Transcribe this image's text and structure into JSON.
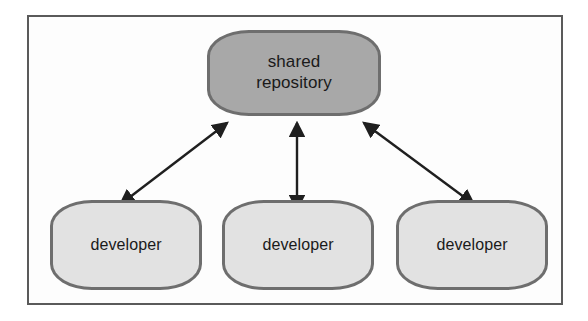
{
  "figure": {
    "type": "diagram",
    "subtype": "centralized-version-control-topology",
    "background_color": "#ffffff",
    "frame": {
      "border_color": "#5a5a5a",
      "fill_color": "#fdfdfd",
      "x": 27,
      "y": 15,
      "width": 536,
      "height": 290
    }
  },
  "nodes": {
    "repository": {
      "id": "shared-repository",
      "label_line1": "shared",
      "label_line2": "repository",
      "fill_color": "#a8a8a8",
      "border_color": "#6e6e6e",
      "x": 207,
      "y": 30,
      "width": 174,
      "height": 86
    },
    "developers": [
      {
        "id": "developer-1",
        "label": "developer",
        "fill_color": "#e2e2e2",
        "border_color": "#6e6e6e",
        "x": 50,
        "y": 200,
        "width": 152,
        "height": 90
      },
      {
        "id": "developer-2",
        "label": "developer",
        "fill_color": "#e2e2e2",
        "border_color": "#6e6e6e",
        "x": 222,
        "y": 200,
        "width": 152,
        "height": 90
      },
      {
        "id": "developer-3",
        "label": "developer",
        "fill_color": "#e2e2e2",
        "border_color": "#6e6e6e",
        "x": 396,
        "y": 200,
        "width": 152,
        "height": 90
      }
    ]
  },
  "connectors": [
    {
      "id": "connector-developer-1",
      "from": "developer-1",
      "to": "shared-repository",
      "style": "double-headed-arrow",
      "color": "#1f1f1f",
      "x1": 130,
      "y1": 197,
      "x2": 227,
      "y2": 123
    },
    {
      "id": "connector-developer-2",
      "from": "developer-2",
      "to": "shared-repository",
      "style": "double-headed-arrow",
      "color": "#1f1f1f",
      "x1": 297,
      "y1": 197,
      "x2": 297,
      "y2": 123
    },
    {
      "id": "connector-developer-3",
      "from": "developer-3",
      "to": "shared-repository",
      "style": "double-headed-arrow",
      "color": "#1f1f1f",
      "x1": 464,
      "y1": 197,
      "x2": 364,
      "y2": 123
    }
  ]
}
